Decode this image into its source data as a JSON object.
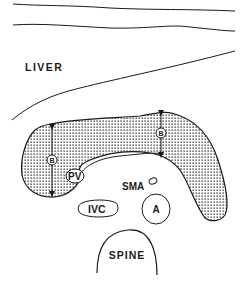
{
  "diagram": {
    "type": "anatomical-cross-section",
    "labels": {
      "liver": "LIVER",
      "pv": "PV",
      "sma": "SMA",
      "ivc": "IVC",
      "aorta": "A",
      "spine": "SPINE"
    },
    "measurements": [
      {
        "id": "head",
        "marker": "B"
      },
      {
        "id": "body",
        "marker": "B"
      }
    ],
    "colors": {
      "line": "#1a1a1a",
      "stipple": "#2a2a2a",
      "background": "#ffffff"
    }
  }
}
